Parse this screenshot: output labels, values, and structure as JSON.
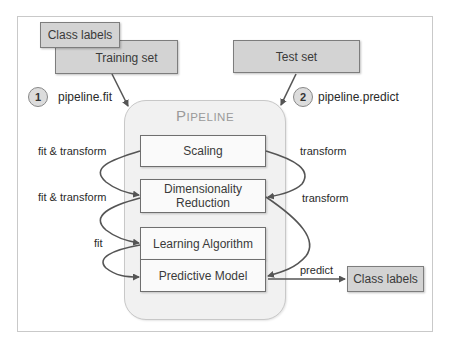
{
  "diagram": {
    "inputs": {
      "class_labels": "Class labels",
      "training_set": "Training set",
      "test_set": "Test set"
    },
    "steps": [
      {
        "number": "1",
        "label": "pipeline.fit"
      },
      {
        "number": "2",
        "label": "pipeline.predict"
      }
    ],
    "pipeline": {
      "title_first": "P",
      "title_rest": "IPELINE",
      "stages": {
        "scaling": "Scaling",
        "dim_reduction_line1": "Dimensionality",
        "dim_reduction_line2": "Reduction",
        "learning_algorithm": "Learning Algorithm",
        "predictive_model": "Predictive Model"
      }
    },
    "edge_labels": {
      "fit_transform_1": "fit & transform",
      "fit_transform_2": "fit & transform",
      "fit": "fit",
      "transform_1": "transform",
      "transform_2": "transform",
      "predict": "predict"
    },
    "output": {
      "class_labels": "Class labels"
    },
    "colors": {
      "input_box_fill": "#d3d3d3",
      "stage_box_fill": "#fafafa",
      "pipeline_fill": "#f1f1f1",
      "arrow": "#555555",
      "title": "#9a9a9a"
    }
  }
}
